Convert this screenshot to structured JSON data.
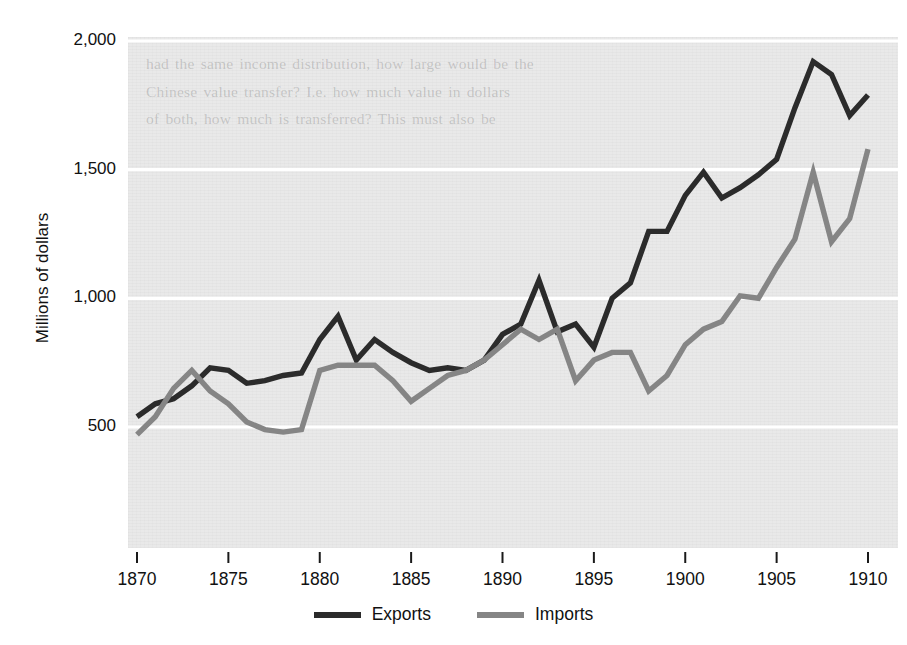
{
  "figure": {
    "background_color": "#ffffff",
    "panel_color": "#e9e9e9",
    "ghost_text": "had the same income distribution, how large would be the\nChinese value transfer? I.e. how much value in dollars\nof both, how much is transferred? This must also be"
  },
  "axis_title_y": "Millions of dollars",
  "legend": {
    "items": [
      {
        "label": "Exports",
        "color": "#2b2b2b"
      },
      {
        "label": "Imports",
        "color": "#858585"
      }
    ]
  },
  "chart_data": {
    "type": "line",
    "title": "",
    "xlabel": "",
    "ylabel": "Millions of dollars",
    "xlim": [
      1870,
      1910
    ],
    "ylim": [
      300,
      2050
    ],
    "xticks": [
      1870,
      1875,
      1880,
      1885,
      1890,
      1895,
      1900,
      1905,
      1910
    ],
    "xtick_labels": [
      "1870",
      "1875",
      "1880",
      "1885",
      "1890",
      "1895",
      "1900",
      "1905",
      "1910"
    ],
    "yticks": [
      500,
      1000,
      1500,
      2000
    ],
    "ytick_labels": [
      "500",
      "1,000",
      "1,500",
      "2,000"
    ],
    "grid": "horizontal",
    "legend_position": "bottom-center",
    "x": [
      1870,
      1871,
      1872,
      1873,
      1874,
      1875,
      1876,
      1877,
      1878,
      1879,
      1880,
      1881,
      1882,
      1883,
      1884,
      1885,
      1886,
      1887,
      1888,
      1889,
      1890,
      1891,
      1892,
      1893,
      1894,
      1895,
      1896,
      1897,
      1898,
      1899,
      1900,
      1901,
      1902,
      1903,
      1904,
      1905,
      1906,
      1907,
      1908,
      1909
    ],
    "series": [
      {
        "name": "Exports",
        "color": "#2b2b2b",
        "values": [
          540,
          590,
          610,
          660,
          730,
          720,
          670,
          680,
          700,
          710,
          840,
          930,
          760,
          840,
          790,
          750,
          720,
          730,
          720,
          760,
          860,
          900,
          1070,
          870,
          900,
          810,
          1000,
          1060,
          1260,
          1260,
          1400,
          1490,
          1390,
          1430,
          1480,
          1540,
          1740,
          1920,
          1870,
          1710
        ]
      },
      {
        "name": "Imports",
        "color": "#858585",
        "values": [
          470,
          540,
          650,
          720,
          640,
          590,
          520,
          490,
          480,
          490,
          720,
          740,
          740,
          740,
          680,
          600,
          650,
          700,
          720,
          760,
          820,
          880,
          840,
          880,
          680,
          760,
          790,
          790,
          640,
          700,
          820,
          880,
          910,
          1010,
          1000,
          1120,
          1230,
          1490,
          1220,
          1310
        ]
      }
    ],
    "series_end_values": {
      "Exports": 1790,
      "Imports": 1580
    }
  }
}
